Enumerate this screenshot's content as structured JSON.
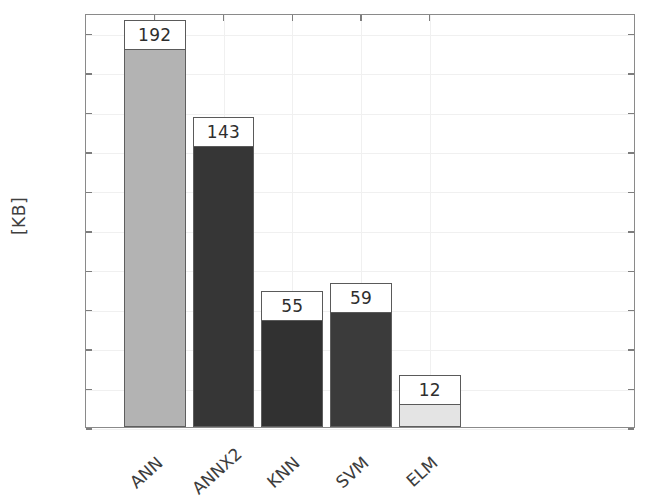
{
  "chart_data": {
    "type": "bar",
    "title": "",
    "xlabel": "",
    "ylabel": "[KB]",
    "categories": [
      "ANN",
      "ANNX2",
      "KNN",
      "SVM",
      "ELM"
    ],
    "values": [
      192,
      143,
      55,
      59,
      12
    ],
    "value_labels": [
      "192",
      "143",
      "55",
      "59",
      "12"
    ],
    "bar_colors": [
      "#b3b3b3",
      "#363636",
      "#313131",
      "#3b3b3b",
      "#e4e4e4"
    ],
    "bar_edge_color": "#5e5e5e",
    "ylim": [
      0,
      210
    ],
    "xlim": [
      0,
      8
    ],
    "yticks": [
      0,
      20,
      40,
      60,
      80,
      100,
      120,
      140,
      160,
      180,
      200
    ],
    "ytick_labels": [
      "0",
      "20",
      "40",
      "60",
      "80",
      "100",
      "120",
      "140",
      "160",
      "180",
      "200"
    ],
    "grid": true,
    "grid_color": "#f0f0f0",
    "legend": "none",
    "axes_color": "#8a8a8a",
    "background": "#ffffff",
    "xtick_rotation_deg": -42,
    "value_label_boxed": true
  },
  "axis": {
    "ylabel_text": "[KB]"
  }
}
